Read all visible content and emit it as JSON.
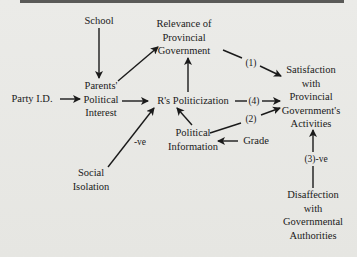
{
  "diagram": {
    "nodes": {
      "school": {
        "label": "School"
      },
      "party_id": {
        "label": "Party I.D."
      },
      "parents_interest": {
        "lines": [
          "Parents'",
          "Political",
          "Interest"
        ]
      },
      "relevance": {
        "lines": [
          "Relevance of",
          "Provincial",
          "Government"
        ]
      },
      "politicization": {
        "label": "R's Politicization"
      },
      "political_info": {
        "lines": [
          "Political",
          "Information"
        ]
      },
      "grade": {
        "label": "Grade"
      },
      "social_isolation": {
        "lines": [
          "Social",
          "Isolation"
        ]
      },
      "satisfaction": {
        "lines": [
          "Satisfaction",
          "with",
          "Provincial",
          "Government's",
          "Activities"
        ]
      },
      "disaffection": {
        "lines": [
          "Disaffection",
          "with",
          "Governmental",
          "Authorities"
        ]
      }
    },
    "edge_labels": {
      "path1": "(1)",
      "path2": "(2)",
      "path3": "(3)-ve",
      "path4": "(4)",
      "social_neg": "-ve"
    },
    "edges": [
      {
        "from": "School",
        "to": "Parents' Political Interest"
      },
      {
        "from": "Party I.D.",
        "to": "Parents' Political Interest"
      },
      {
        "from": "Parents' Political Interest",
        "to": "Relevance of Provincial Government"
      },
      {
        "from": "Parents' Political Interest",
        "to": "R's Politicization"
      },
      {
        "from": "R's Politicization",
        "to": "Relevance of Provincial Government"
      },
      {
        "from": "Social Isolation",
        "to": "R's Politicization",
        "label": "-ve"
      },
      {
        "from": "Political Information",
        "to": "R's Politicization"
      },
      {
        "from": "Grade",
        "to": "Political Information"
      },
      {
        "from": "Relevance of Provincial Government",
        "to": "Satisfaction with Provincial Government's Activities",
        "label": "(1)"
      },
      {
        "from": "R's Politicization",
        "to": "Satisfaction with Provincial Government's Activities",
        "label": "(4)"
      },
      {
        "from": "Political Information",
        "to": "Satisfaction with Provincial Government's Activities",
        "label": "(2)"
      },
      {
        "from": "Disaffection with Governmental Authorities",
        "to": "Satisfaction with Provincial Government's Activities",
        "label": "(3)-ve"
      }
    ],
    "colors": {
      "ink": "#1a1a1a",
      "paper": "#e9e9e6",
      "topbar": "#5a5a58"
    }
  }
}
